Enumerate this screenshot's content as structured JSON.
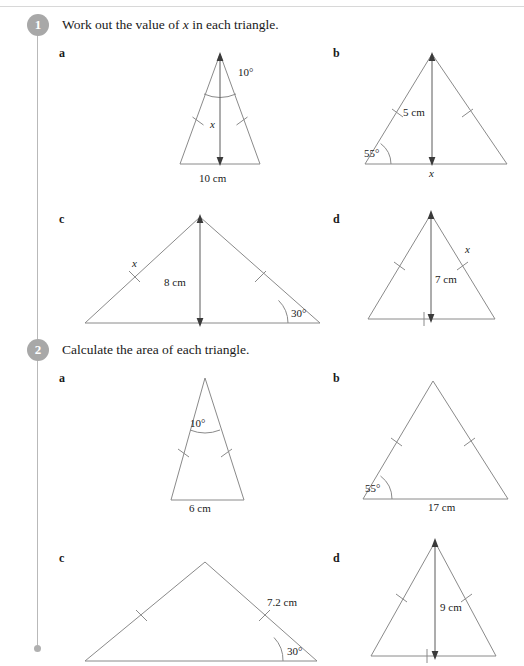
{
  "page": {
    "width": 524,
    "height": 666,
    "line_color": "#8a8a8a",
    "arrow_color": "#5a5a5a",
    "text_color": "#1a1a1a",
    "badge_color": "#a8a8a8",
    "spine_color": "#b9b9b9"
  },
  "questions": [
    {
      "number": "1",
      "prompt_before": "Work out the value of ",
      "prompt_var": "x",
      "prompt_after": " in each triangle.",
      "parts": [
        {
          "label": "a",
          "shape": "tall-isosceles",
          "apex_angle": "10°",
          "base_label": "10 cm",
          "height_label": "x",
          "height_label_italic": true,
          "has_height_arrow": true,
          "has_apex_arc": true,
          "side_ticks": 2,
          "base_tick": false,
          "base_angle": null
        },
        {
          "label": "b",
          "shape": "wide-isosceles",
          "apex_angle": null,
          "base_label": "x",
          "base_label_italic": true,
          "height_label": "5 cm",
          "has_height_arrow": true,
          "has_apex_arc": false,
          "side_ticks": 2,
          "base_tick": false,
          "base_angle": "55°"
        },
        {
          "label": "c",
          "shape": "scalene-wide",
          "apex_angle": null,
          "base_label": "",
          "height_label": "8 cm",
          "has_height_arrow": true,
          "has_apex_arc": false,
          "side_ticks": 2,
          "side_label": "x",
          "side_label_italic": true,
          "base_tick": false,
          "base_angle": "30°"
        },
        {
          "label": "d",
          "shape": "isosceles",
          "apex_angle": null,
          "base_label": "",
          "height_label": "7 cm",
          "has_height_arrow": true,
          "has_apex_arc": false,
          "side_ticks": 2,
          "side_label": "x",
          "side_label_italic": true,
          "base_tick": true,
          "base_angle": null
        }
      ]
    },
    {
      "number": "2",
      "prompt_before": "Calculate the area of each triangle.",
      "prompt_var": "",
      "prompt_after": "",
      "parts": [
        {
          "label": "a",
          "shape": "tall-isosceles",
          "apex_angle": "10°",
          "base_label": "6 cm",
          "height_label": "",
          "has_height_arrow": false,
          "has_apex_arc": true,
          "side_ticks": 2,
          "base_tick": false,
          "base_angle": null
        },
        {
          "label": "b",
          "shape": "wide-isosceles",
          "apex_angle": null,
          "base_label": "17 cm",
          "height_label": "",
          "has_height_arrow": false,
          "has_apex_arc": false,
          "side_ticks": 2,
          "base_tick": false,
          "base_angle": "55°"
        },
        {
          "label": "c",
          "shape": "scalene-wide",
          "apex_angle": null,
          "base_label": "",
          "height_label": "",
          "has_height_arrow": false,
          "has_apex_arc": false,
          "side_ticks": 2,
          "side_label": "7.2 cm",
          "side_label_italic": false,
          "base_tick": false,
          "base_angle": "30°"
        },
        {
          "label": "d",
          "shape": "isosceles",
          "apex_angle": null,
          "base_label": "",
          "height_label": "9 cm",
          "has_height_arrow": true,
          "has_apex_arc": false,
          "side_ticks": 2,
          "side_label": "",
          "base_tick": true,
          "base_angle": null
        }
      ]
    }
  ]
}
